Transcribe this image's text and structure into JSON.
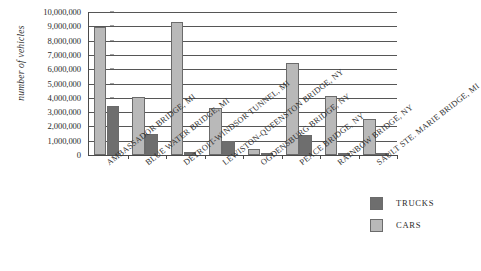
{
  "chart_data": {
    "type": "bar",
    "title": "",
    "xlabel": "",
    "ylabel": "number of vehicles",
    "ylim": [
      0,
      10000000
    ],
    "ytick_step": 1000000,
    "grid": true,
    "grid_axis": "y",
    "legend_position": "bottom-right",
    "orientation": "vertical",
    "group_mode": "grouped",
    "categories": [
      "AMBASSADOR BRIDGE, MI",
      "BLUE WATER BRIDGE, MI",
      "DETROIT-WINDSOR TUNNEL, MI",
      "LEWISTON-QUEENSTON BRIDGE, NY",
      "OGDENSBURG BRIDGE, NY",
      "PEACE BRIDGE, NY",
      "RAINBOW BRIDGE, NY",
      "SAULT STE. MARIE BRIDGE, MI"
    ],
    "series": [
      {
        "name": "CARS",
        "color": "#b9b9b9",
        "values": [
          8950000,
          4050000,
          9300000,
          3300000,
          450000,
          6450000,
          4150000,
          2550000
        ]
      },
      {
        "name": "TRUCKS",
        "color": "#6e6e6e",
        "values": [
          3400000,
          1450000,
          200000,
          950000,
          60000,
          1400000,
          0,
          150000
        ]
      }
    ],
    "ytick_labels": [
      "0",
      "1,000,000",
      "2,000,000",
      "3,000,000",
      "4,000,000",
      "5,000,000",
      "6,000,000",
      "7,000,000",
      "8,000,000",
      "9,000,000",
      "10,000,000"
    ]
  },
  "legend": {
    "items": [
      {
        "label": "TRUCKS",
        "swatch": "trucks"
      },
      {
        "label": "CARS",
        "swatch": "cars"
      }
    ]
  }
}
